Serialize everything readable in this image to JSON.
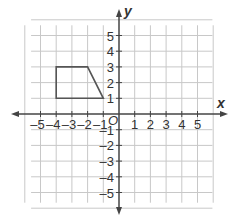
{
  "chart_data": {
    "type": "coordinate-plane",
    "xlabel": "x",
    "ylabel": "y",
    "origin_label": "O",
    "xlim": [
      -6,
      6
    ],
    "ylim": [
      -6,
      6
    ],
    "grid": true,
    "x_ticks": [
      -5,
      -4,
      -3,
      -2,
      -1,
      1,
      2,
      3,
      4,
      5
    ],
    "y_ticks": [
      -5,
      -4,
      -3,
      -2,
      -1,
      1,
      2,
      3,
      4,
      5
    ],
    "x_tick_labels": [
      "–5",
      "–4",
      "–3",
      "–2",
      "–1",
      "1",
      "2",
      "3",
      "4",
      "5"
    ],
    "y_tick_labels": [
      "–5",
      "–4",
      "–3",
      "–2",
      "–1",
      "1",
      "2",
      "3",
      "4",
      "5"
    ],
    "shapes": [
      {
        "name": "trapezoid",
        "vertices": [
          [
            -4,
            1
          ],
          [
            -4,
            3
          ],
          [
            -2,
            3
          ],
          [
            -1,
            1
          ]
        ],
        "stroke": "#555555"
      }
    ]
  },
  "colors": {
    "grid": "#c8c8c8",
    "axis": "#444444",
    "text": "#333333"
  }
}
